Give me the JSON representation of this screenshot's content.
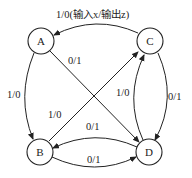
{
  "diagram": {
    "type": "state-transition-diagram",
    "nodes": [
      {
        "id": "A",
        "label": "A"
      },
      {
        "id": "B",
        "label": "B"
      },
      {
        "id": "C",
        "label": "C"
      },
      {
        "id": "D",
        "label": "D"
      }
    ],
    "edges": [
      {
        "from": "C",
        "to": "A",
        "label": "1/0(输入x/输出z)"
      },
      {
        "from": "A",
        "to": "D",
        "label": "0/1"
      },
      {
        "from": "A",
        "to": "B",
        "label": "1/0"
      },
      {
        "from": "B",
        "to": "C",
        "label": "1/0"
      },
      {
        "from": "D",
        "to": "C",
        "label": "1/0"
      },
      {
        "from": "C",
        "to": "D",
        "label": "0/1"
      },
      {
        "from": "D",
        "to": "B",
        "label": "0/1"
      },
      {
        "from": "B",
        "to": "D",
        "label": "0/1"
      }
    ]
  }
}
